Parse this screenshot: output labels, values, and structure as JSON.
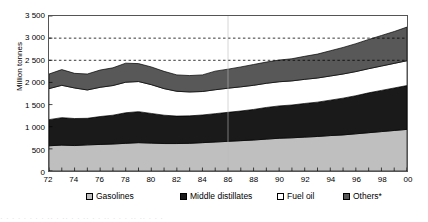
{
  "chart_data": {
    "type": "area",
    "title": "",
    "subtitle": "",
    "xlabel": "",
    "ylabel": "Million tonnes",
    "ylim": [
      0,
      3500
    ],
    "ytick_step": 500,
    "yticks": [
      "0",
      "500",
      "1 000",
      "1 500",
      "2 000",
      "2 500",
      "3 000",
      "3 500"
    ],
    "grid": "horizontal dashed gridlines at 2 500 and 3 000 only",
    "legend_position": "bottom",
    "stacked": true,
    "x": [
      "72",
      "73",
      "74",
      "75",
      "76",
      "77",
      "78",
      "79",
      "80",
      "81",
      "82",
      "83",
      "84",
      "85",
      "86",
      "87",
      "88",
      "89",
      "90",
      "91",
      "92",
      "93",
      "94",
      "95",
      "96",
      "97",
      "98",
      "99",
      "00"
    ],
    "xtick_labels": [
      "72",
      "74",
      "76",
      "78",
      "80",
      "82",
      "84",
      "86",
      "88",
      "90",
      "92",
      "94",
      "96",
      "98",
      "00"
    ],
    "series": [
      {
        "name": "Gasolines",
        "color": "#bfbfbf",
        "values": [
          570,
          585,
          575,
          590,
          600,
          610,
          625,
          640,
          630,
          620,
          620,
          625,
          640,
          655,
          670,
          685,
          700,
          720,
          740,
          750,
          765,
          780,
          800,
          815,
          840,
          865,
          890,
          915,
          940
        ]
      },
      {
        "name": "Middle distillates",
        "color": "#1a1a1a",
        "values": [
          590,
          620,
          610,
          600,
          630,
          650,
          690,
          700,
          670,
          640,
          620,
          620,
          625,
          640,
          655,
          670,
          690,
          715,
          730,
          740,
          760,
          775,
          800,
          830,
          860,
          900,
          930,
          960,
          990
        ]
      },
      {
        "name": "Fuel oil",
        "color": "#ffffff",
        "values": [
          700,
          730,
          690,
          640,
          660,
          670,
          690,
          680,
          650,
          600,
          560,
          540,
          530,
          540,
          545,
          545,
          545,
          545,
          545,
          545,
          545,
          545,
          545,
          545,
          545,
          545,
          550,
          555,
          560
        ]
      },
      {
        "name": "Others*",
        "color": "#585858",
        "values": [
          330,
          355,
          330,
          360,
          390,
          400,
          430,
          405,
          400,
          390,
          370,
          370,
          375,
          420,
          430,
          450,
          470,
          480,
          490,
          500,
          520,
          540,
          570,
          600,
          630,
          660,
          690,
          720,
          760
        ]
      }
    ],
    "totals": [
      2190,
      2290,
      2205,
      2190,
      2280,
      2330,
      2435,
      2425,
      2350,
      2250,
      2170,
      2155,
      2170,
      2255,
      2300,
      2350,
      2405,
      2460,
      2505,
      2535,
      2590,
      2640,
      2715,
      2790,
      2875,
      2970,
      3060,
      3150,
      3250
    ]
  },
  "axis": {
    "y_title": "Million tonnes"
  },
  "legend": {
    "items": [
      {
        "label": "Gasolines",
        "swatch": "#bfbfbf"
      },
      {
        "label": "Middle distillates",
        "swatch": "#1a1a1a"
      },
      {
        "label": "Fuel oil",
        "swatch": "#ffffff"
      },
      {
        "label": "Others*",
        "swatch": "#585858"
      }
    ]
  },
  "bleed": {
    "text": "· · ·   · ·  ·  · ·  ·· ·  ·· ·   · ·· · ·  ·· · ·  ·  ··  ·· · · ·"
  }
}
